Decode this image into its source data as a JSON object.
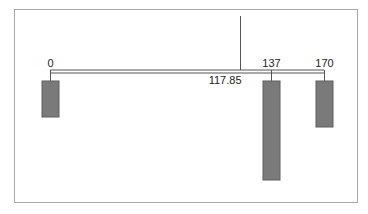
{
  "diagram": {
    "type": "balance-beam",
    "axis": {
      "min": 0,
      "max": 170,
      "x0_px": 50,
      "x1_px": 324,
      "beam_y": 70
    },
    "pivot": {
      "value": 117.85,
      "label": "117.85"
    },
    "weights": [
      {
        "position": 0,
        "label": "0",
        "bar_top": 81,
        "bar_bottom": 117
      },
      {
        "position": 137,
        "label": "137",
        "bar_top": 81,
        "bar_bottom": 180
      },
      {
        "position": 170,
        "label": "170",
        "bar_top": 81,
        "bar_bottom": 127
      }
    ],
    "colors": {
      "bar": "#7a7a7a",
      "bar_border": "#5e5e5e",
      "line": "#555555",
      "frame": "#a8a8a8"
    }
  }
}
